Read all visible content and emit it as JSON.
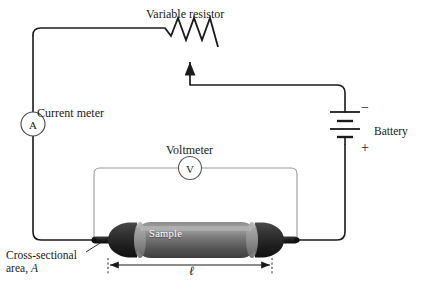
{
  "figure": {
    "background_color": "#ffffff",
    "wire_color": "#1a1a1a",
    "voltmeter_wire_color": "#9a9a9a",
    "sample_body_color": "#6e6e6e",
    "sample_cap_color": "#2a2a2a"
  },
  "labels": {
    "variable_resistor": "Variable resistor",
    "current_meter": "Current meter",
    "battery": "Battery",
    "voltmeter": "Voltmeter",
    "cross_section_line1": "Cross-sectional",
    "cross_section_line2_prefix": "area, ",
    "cross_section_line2_symbol": "A",
    "length_symbol": "ℓ",
    "sample": "Sample"
  },
  "symbols": {
    "ammeter_glyph": "A",
    "voltmeter_glyph": "V",
    "battery_negative": "−",
    "battery_positive": "+"
  },
  "components": [
    {
      "name": "variable-resistor",
      "type": "resistor",
      "label": "Variable resistor"
    },
    {
      "name": "current-meter",
      "type": "ammeter",
      "label": "Current meter",
      "glyph": "A"
    },
    {
      "name": "voltmeter",
      "type": "voltmeter",
      "label": "Voltmeter",
      "glyph": "V"
    },
    {
      "name": "battery",
      "type": "battery",
      "label": "Battery",
      "terminals": [
        "−",
        "+"
      ]
    },
    {
      "name": "sample",
      "type": "specimen",
      "label": "Sample"
    }
  ],
  "dimensions": {
    "length_label": "ℓ",
    "area_label": "A"
  }
}
